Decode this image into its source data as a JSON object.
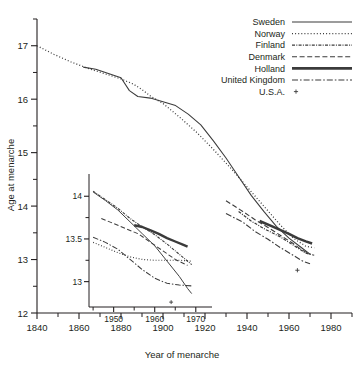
{
  "chart_data": {
    "type": "line",
    "title": "",
    "xlabel": "Year of menarche",
    "ylabel": "Age at menarche",
    "xlim": [
      1840,
      1990
    ],
    "ylim": [
      12,
      17.5
    ],
    "x_major_ticks": [
      1840,
      1860,
      1880,
      1900,
      1920,
      1940,
      1960,
      1980
    ],
    "x_minor_ticks": [
      1850,
      1870,
      1890,
      1910,
      1930,
      1950,
      1970,
      1990
    ],
    "y_major_ticks": [
      12,
      13,
      14,
      15,
      16,
      17
    ],
    "y_minor_ticks": [
      12.5,
      13.5,
      14.5,
      15.5,
      16.5,
      17.5
    ],
    "grid": false,
    "legend_position": "top-right",
    "series": [
      {
        "name": "Sweden",
        "style": "solid-thin",
        "points": [
          [
            1862,
            16.6
          ],
          [
            1868,
            16.56
          ],
          [
            1874,
            16.48
          ],
          [
            1880,
            16.4
          ],
          [
            1884,
            16.16
          ],
          [
            1888,
            16.05
          ],
          [
            1894,
            16.02
          ],
          [
            1900,
            15.95
          ],
          [
            1906,
            15.88
          ],
          [
            1912,
            15.72
          ],
          [
            1918,
            15.52
          ],
          [
            1924,
            15.22
          ],
          [
            1930,
            14.9
          ],
          [
            1936,
            14.55
          ],
          [
            1942,
            14.2
          ],
          [
            1948,
            13.9
          ],
          [
            1954,
            13.62
          ],
          [
            1960,
            13.4
          ],
          [
            1966,
            13.22
          ],
          [
            1970,
            13.1
          ]
        ]
      },
      {
        "name": "Norway",
        "style": "dotted",
        "points": [
          [
            1840,
            17.0
          ],
          [
            1848,
            16.84
          ],
          [
            1856,
            16.7
          ],
          [
            1864,
            16.58
          ],
          [
            1872,
            16.48
          ],
          [
            1880,
            16.38
          ],
          [
            1886,
            16.28
          ],
          [
            1890,
            16.18
          ],
          [
            1894,
            16.06
          ],
          [
            1900,
            15.92
          ],
          [
            1908,
            15.66
          ],
          [
            1916,
            15.38
          ],
          [
            1924,
            15.06
          ],
          [
            1932,
            14.72
          ],
          [
            1940,
            14.36
          ],
          [
            1948,
            14.0
          ],
          [
            1956,
            13.64
          ],
          [
            1962,
            13.4
          ],
          [
            1968,
            13.25
          ],
          [
            1972,
            13.22
          ]
        ]
      },
      {
        "name": "Finland",
        "style": "dash-dot-tight",
        "points": [
          [
            1936,
            13.9
          ],
          [
            1942,
            13.72
          ],
          [
            1948,
            13.58
          ],
          [
            1952,
            13.5
          ],
          [
            1956,
            13.42
          ],
          [
            1960,
            13.32
          ],
          [
            1964,
            13.22
          ],
          [
            1968,
            13.12
          ],
          [
            1972,
            13.08
          ]
        ]
      },
      {
        "name": "Denmark",
        "style": "dashed",
        "points": [
          [
            1930,
            14.1
          ],
          [
            1938,
            13.9
          ],
          [
            1944,
            13.74
          ],
          [
            1950,
            13.6
          ],
          [
            1956,
            13.45
          ],
          [
            1962,
            13.3
          ],
          [
            1966,
            13.18
          ],
          [
            1970,
            13.1
          ]
        ]
      },
      {
        "name": "Holland",
        "style": "solid-thick",
        "points": [
          [
            1946,
            13.72
          ],
          [
            1952,
            13.62
          ],
          [
            1956,
            13.55
          ],
          [
            1960,
            13.48
          ],
          [
            1964,
            13.4
          ],
          [
            1968,
            13.34
          ],
          [
            1971,
            13.3
          ]
        ]
      },
      {
        "name": "United Kingdom",
        "style": "dash-dot",
        "points": [
          [
            1930,
            13.86
          ],
          [
            1938,
            13.7
          ],
          [
            1944,
            13.52
          ],
          [
            1950,
            13.38
          ],
          [
            1956,
            13.22
          ],
          [
            1962,
            13.08
          ],
          [
            1966,
            12.98
          ],
          [
            1970,
            12.92
          ]
        ]
      },
      {
        "name": "U.S.A.",
        "style": "marker",
        "points": [
          [
            1964,
            12.8
          ]
        ]
      }
    ],
    "inset": {
      "xlim": [
        1944,
        1972
      ],
      "ylim": [
        12.82,
        14.12
      ],
      "x_major_ticks": [
        1950,
        1960,
        1970
      ],
      "x_minor_ticks": [
        1945,
        1955,
        1965
      ],
      "y_major_ticks": [
        13,
        13.5,
        14
      ],
      "y_minor_ticks": [
        13.25,
        13.75
      ],
      "x_tick_labels": [
        "1950",
        "1960",
        "1970"
      ],
      "y_tick_labels": [
        "13",
        "13.5",
        "14"
      ],
      "series": [
        {
          "name": "Sweden",
          "style": "solid-thin",
          "points": [
            [
              1945,
              14.05
            ],
            [
              1948,
              13.95
            ],
            [
              1951,
              13.84
            ],
            [
              1954,
              13.7
            ],
            [
              1957,
              13.56
            ],
            [
              1960,
              13.42
            ],
            [
              1963,
              13.24
            ],
            [
              1966,
              13.06
            ],
            [
              1968,
              12.92
            ],
            [
              1969,
              12.86
            ]
          ]
        },
        {
          "name": "Norway",
          "style": "dotted",
          "points": [
            [
              1945,
              13.46
            ],
            [
              1948,
              13.4
            ],
            [
              1951,
              13.34
            ],
            [
              1954,
              13.29
            ],
            [
              1957,
              13.26
            ],
            [
              1960,
              13.25
            ],
            [
              1963,
              13.25
            ],
            [
              1966,
              13.25
            ],
            [
              1969,
              13.24
            ]
          ]
        },
        {
          "name": "Finland",
          "style": "dash-dot-tight",
          "points": [
            [
              1945,
              14.06
            ],
            [
              1948,
              13.96
            ],
            [
              1951,
              13.86
            ],
            [
              1954,
              13.74
            ],
            [
              1957,
              13.64
            ],
            [
              1960,
              13.55
            ],
            [
              1963,
              13.44
            ],
            [
              1966,
              13.32
            ],
            [
              1969,
              13.2
            ]
          ]
        },
        {
          "name": "Denmark",
          "style": "dashed",
          "points": [
            [
              1947,
              13.74
            ],
            [
              1950,
              13.68
            ],
            [
              1953,
              13.62
            ],
            [
              1956,
              13.56
            ],
            [
              1959,
              13.46
            ],
            [
              1962,
              13.36
            ],
            [
              1965,
              13.26
            ],
            [
              1968,
              13.19
            ]
          ]
        },
        {
          "name": "Holland",
          "style": "solid-thick",
          "points": [
            [
              1955,
              13.66
            ],
            [
              1957,
              13.64
            ],
            [
              1959,
              13.6
            ],
            [
              1961,
              13.56
            ],
            [
              1963,
              13.51
            ],
            [
              1965,
              13.47
            ],
            [
              1967,
              13.43
            ],
            [
              1968,
              13.41
            ]
          ]
        },
        {
          "name": "United Kingdom",
          "style": "dash-dot",
          "points": [
            [
              1945,
              13.52
            ],
            [
              1948,
              13.46
            ],
            [
              1951,
              13.38
            ],
            [
              1954,
              13.26
            ],
            [
              1957,
              13.14
            ],
            [
              1960,
              13.04
            ],
            [
              1963,
              12.98
            ],
            [
              1966,
              12.96
            ],
            [
              1969,
              12.95
            ]
          ]
        },
        {
          "name": "U.S.A.",
          "style": "marker",
          "points": [
            [
              1964,
              12.76
            ]
          ]
        }
      ]
    }
  },
  "legend": {
    "items": [
      {
        "label": "Sweden",
        "style": "solid-thin"
      },
      {
        "label": "Norway",
        "style": "dotted"
      },
      {
        "label": "Finland",
        "style": "dash-dot-tight"
      },
      {
        "label": "Denmark",
        "style": "dashed"
      },
      {
        "label": "Holland",
        "style": "solid-thick"
      },
      {
        "label": "United Kingdom",
        "style": "dash-dot"
      },
      {
        "label": "U.S.A.",
        "style": "marker"
      }
    ]
  },
  "colors": {
    "ink": "#3b3b3b",
    "axis": "#231f20",
    "background": "#ffffff"
  }
}
